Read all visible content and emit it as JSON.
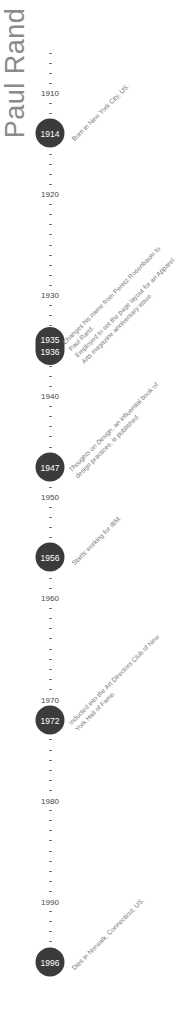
{
  "title": "Paul Rand",
  "colors": {
    "dot": "#3b3b3b",
    "dot_text": "#ffffff",
    "title": "#8a8a8a",
    "label": "#444444",
    "event_text": "#777777"
  },
  "axis": {
    "start_year": 1906,
    "end_year": 1996,
    "px_per_year": 10.1,
    "origin_y": 52.6,
    "decades": [
      {
        "label": "1910",
        "y": 93
      },
      {
        "label": "1920",
        "y": 194
      },
      {
        "label": "1930",
        "y": 295
      },
      {
        "label": "1940",
        "y": 396
      },
      {
        "label": "1950",
        "y": 497
      },
      {
        "label": "1960",
        "y": 598
      },
      {
        "label": "1970",
        "y": 700
      },
      {
        "label": "1980",
        "y": 801
      },
      {
        "label": "1990",
        "y": 902
      }
    ]
  },
  "events": [
    {
      "years": [
        "1914"
      ],
      "y": 133,
      "lines": [
        "Born in New York City, US."
      ]
    },
    {
      "years": [
        "1935",
        "1936"
      ],
      "y": 346,
      "lines": [
        "Changes his name from Peretz Rosenbaum to",
        "Paul Rand.",
        "Employed to set the page layout for an Apparel",
        "Arts magazine anniversary issue."
      ]
    },
    {
      "years": [
        "1947"
      ],
      "y": 467,
      "lines": [
        "Thoughts on Design, an influential book of",
        "design practices, is published."
      ]
    },
    {
      "years": [
        "1956"
      ],
      "y": 557,
      "lines": [
        "Starts working for IBM."
      ]
    },
    {
      "years": [
        "1972"
      ],
      "y": 720,
      "lines": [
        "Inducted into the Art Directors Club of New",
        "York Hall of Fame."
      ]
    },
    {
      "years": [
        "1996"
      ],
      "y": 962,
      "lines": [
        "Dies in Norwalk, Connecticut, US."
      ]
    }
  ]
}
